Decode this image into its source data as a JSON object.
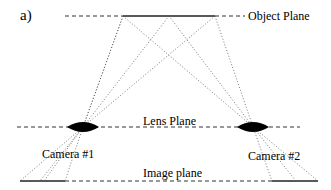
{
  "figure": {
    "panel_label": "a)",
    "object_plane_label": "Object Plane",
    "lens_plane_label": "Lens Plane",
    "image_plane_label": "Image plane",
    "camera1_label": "Camera #1",
    "camera2_label": "Camera #2"
  },
  "geometry": {
    "object_plane_y": 16,
    "lens_plane_y": 127,
    "image_plane_y": 181,
    "object_points_x": [
      123,
      169,
      215
    ],
    "lens_centers_x": [
      83,
      253
    ],
    "camera1_image_x": [
      65,
      44,
      20
    ],
    "camera2_image_x": [
      318,
      296,
      272
    ]
  },
  "colors": {
    "line": "#000000",
    "ray": "#555555"
  }
}
